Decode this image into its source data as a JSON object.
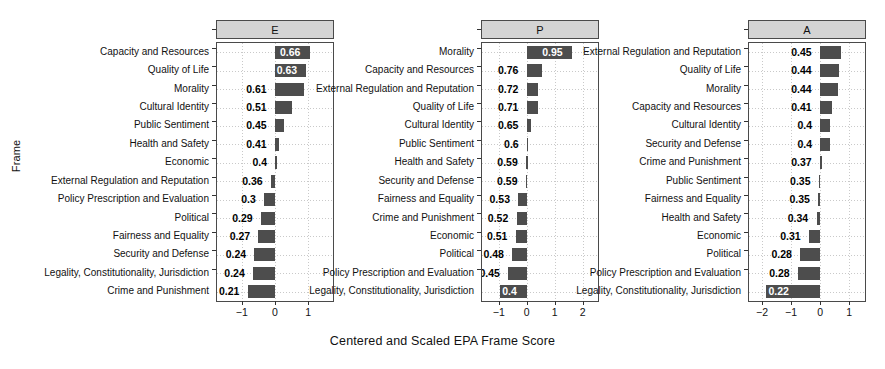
{
  "chart_data": {
    "type": "bar",
    "title": "",
    "xlabel": "Centered and Scaled EPA Frame Score",
    "ylabel": "Frame",
    "orientation": "horizontal",
    "grid": true,
    "legend": null,
    "panels": [
      {
        "label": "E",
        "xlim": [
          -1.75,
          1.75
        ],
        "xticks": [
          -1,
          0,
          1
        ],
        "xticklabels": [
          "−1",
          "0",
          "1"
        ],
        "categories": [
          "Capacity and Resources",
          "Quality of Life",
          "Morality",
          "Cultural Identity",
          "Public Sentiment",
          "Health and Safety",
          "Economic",
          "External Regulation and Reputation",
          "Policy Prescription and Evaluation",
          "Political",
          "Fairness and Equality",
          "Security and Defense",
          "Legality, Constitutionality,  Jurisdiction",
          "Crime and Punishment"
        ],
        "values": [
          0.66,
          0.63,
          0.61,
          0.51,
          0.45,
          0.41,
          0.4,
          0.36,
          0.3,
          0.29,
          0.27,
          0.24,
          0.24,
          0.21
        ],
        "bar_extents": [
          1.05,
          0.95,
          0.88,
          0.52,
          0.28,
          0.13,
          0.0,
          -0.12,
          -0.34,
          -0.42,
          -0.5,
          -0.62,
          -0.66,
          -0.82
        ],
        "labels": [
          "0.66",
          "0.63",
          "0.61",
          "0.51",
          "0.45",
          "0.41",
          "0.4",
          "0.36",
          "0.3",
          "0.29",
          "0.27",
          "0.24",
          "0.24",
          "0.21"
        ]
      },
      {
        "label": "P",
        "xlim": [
          -1.6,
          2.55
        ],
        "xticks": [
          -1,
          0,
          1,
          2
        ],
        "xticklabels": [
          "−1",
          "0",
          "1",
          "2"
        ],
        "categories": [
          "Morality",
          "Capacity and Resources",
          "External Regulation and Reputation",
          "Quality of Life",
          "Cultural Identity",
          "Public Sentiment",
          "Health and Safety",
          "Security and Defense",
          "Fairness and Equality",
          "Crime and Punishment",
          "Economic",
          "Political",
          "Policy Prescription and Evaluation",
          "Legality, Constitutionality,  Jurisdiction"
        ],
        "values": [
          0.95,
          0.76,
          0.72,
          0.71,
          0.65,
          0.6,
          0.59,
          0.59,
          0.53,
          0.52,
          0.51,
          0.48,
          0.45,
          0.4
        ],
        "bar_extents": [
          1.62,
          0.56,
          0.42,
          0.4,
          0.17,
          0.0,
          -0.02,
          -0.03,
          -0.3,
          -0.36,
          -0.39,
          -0.52,
          -0.66,
          -0.95
        ],
        "labels": [
          "0.95",
          "0.76",
          "0.72",
          "0.71",
          "0.65",
          "0.6",
          "0.59",
          "0.59",
          "0.53",
          "0.52",
          "0.51",
          "0.48",
          "0.45",
          "0.4"
        ]
      },
      {
        "label": "A",
        "xlim": [
          -2.45,
          1.55
        ],
        "xticks": [
          -2,
          -1,
          0,
          1
        ],
        "xticklabels": [
          "−2",
          "−1",
          "0",
          "1"
        ],
        "categories": [
          "External Regulation and Reputation",
          "Quality of Life",
          "Morality",
          "Capacity and Resources",
          "Cultural Identity",
          "Security and Defense",
          "Crime and Punishment",
          "Public Sentiment",
          "Fairness and Equality",
          "Health and Safety",
          "Economic",
          "Political",
          "Policy Prescription and Evaluation",
          "Legality, Constitutionality,  Jurisdiction"
        ],
        "values": [
          0.45,
          0.44,
          0.44,
          0.41,
          0.4,
          0.4,
          0.37,
          0.35,
          0.35,
          0.34,
          0.31,
          0.28,
          0.28,
          0.22
        ],
        "bar_extents": [
          0.72,
          0.64,
          0.62,
          0.42,
          0.35,
          0.33,
          0.06,
          -0.04,
          -0.06,
          -0.12,
          -0.38,
          -0.68,
          -0.76,
          -1.85
        ],
        "labels": [
          "0.45",
          "0.44",
          "0.44",
          "0.41",
          "0.4",
          "0.4",
          "0.37",
          "0.35",
          "0.35",
          "0.34",
          "0.31",
          "0.28",
          "0.28",
          "0.22"
        ]
      }
    ],
    "colors": {
      "bar": "#4d4d4d",
      "strip": "#d4d4d4",
      "panel_border": "#4a4a4a",
      "grid": "#c9c9c9",
      "label_inside": "#ffffff",
      "label_outside": "#000000"
    }
  }
}
